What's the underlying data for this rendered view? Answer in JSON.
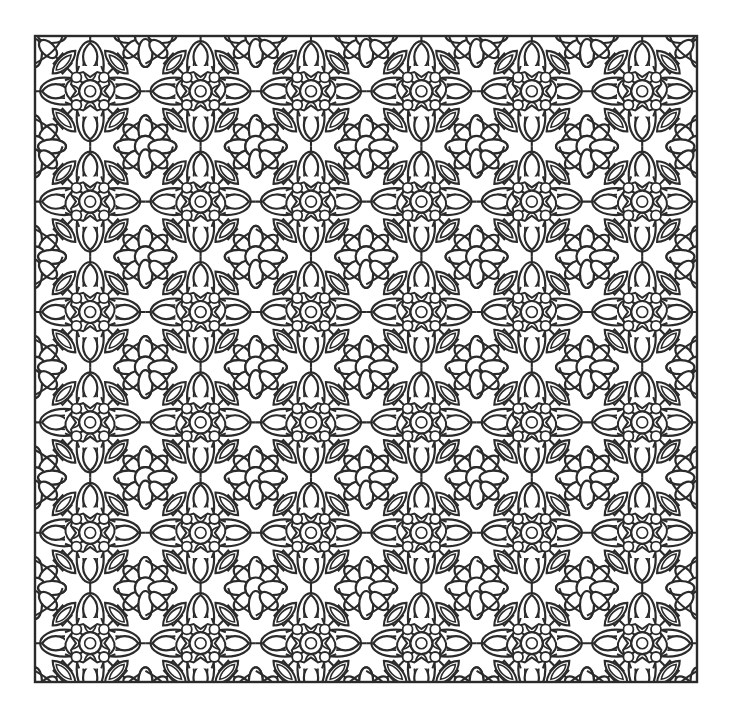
{
  "page": {
    "kind": "line-art-coloring-page",
    "canvas_width": 730,
    "canvas_height": 715,
    "background_color": "#ffffff"
  },
  "artwork": {
    "name": "seamless-floral-kaleidoscope",
    "description": "Dense black-and-white symmetric floral lace pattern for coloring",
    "line_color": "#2b2b2b",
    "fill_color": "#ffffff",
    "stroke_width": 2.2,
    "thin_stroke_width": 1.7,
    "frame": {
      "name": "outer-frame",
      "x": 35,
      "y": 36,
      "width": 662,
      "height": 646,
      "stroke_width": 2.4,
      "color": "#2b2b2b"
    },
    "tile": {
      "size": 110.4,
      "columns": 6,
      "rows": 6,
      "symmetry": "p4m mirrored kaleidoscope"
    },
    "motifs": [
      {
        "name": "four-petal-flower",
        "count_per_tile": 1,
        "petal_count": 4
      },
      {
        "name": "flower-center-circle",
        "radius": 11
      },
      {
        "name": "teardrop-petal",
        "count_per_tile": 8
      },
      {
        "name": "tulip-bud",
        "count_per_tile": 4
      },
      {
        "name": "small-rosette",
        "petal_count": 8
      },
      {
        "name": "lozenge-diamond",
        "count_per_tile": 4
      },
      {
        "name": "corner-arc-scroll",
        "count_per_tile": 4
      },
      {
        "name": "lattice-grid-line",
        "count_per_tile": 4
      }
    ]
  }
}
